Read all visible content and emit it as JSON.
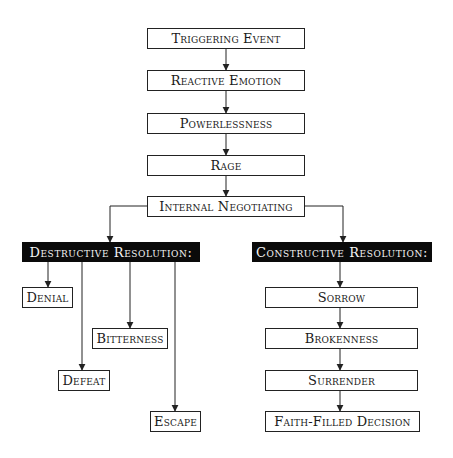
{
  "diagram": {
    "main_flow": [
      {
        "label": "Triggering Event"
      },
      {
        "label": "Reactive Emotion"
      },
      {
        "label": "Powerlessness"
      },
      {
        "label": "Rage"
      },
      {
        "label": "Internal Negotiating"
      }
    ],
    "destructive": {
      "heading": "Destructive Resolution:",
      "outcomes": [
        {
          "label": "Denial"
        },
        {
          "label": "Bitterness"
        },
        {
          "label": "Defeat"
        },
        {
          "label": "Escape"
        }
      ]
    },
    "constructive": {
      "heading": "Constructive Resolution:",
      "steps": [
        {
          "label": "Sorrow"
        },
        {
          "label": "Brokenness"
        },
        {
          "label": "Surrender"
        },
        {
          "label": "Faith-Filled Decision"
        }
      ]
    },
    "colors": {
      "heading_bg": "#0a0a0a",
      "heading_text": "#f4f4f4",
      "box_border": "#222222",
      "line": "#222222"
    }
  }
}
